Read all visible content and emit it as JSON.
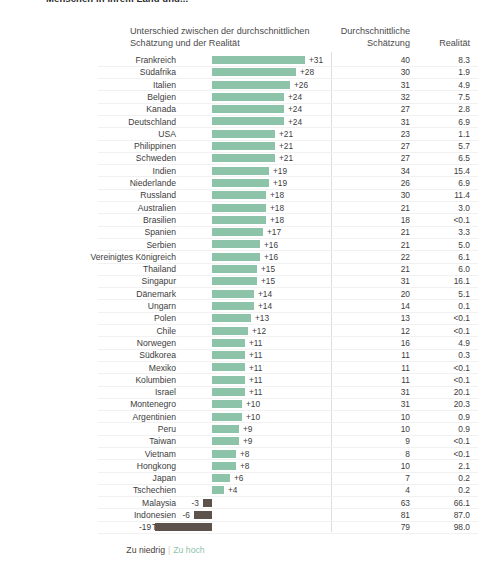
{
  "title": "Menschen in ihrem Land und...",
  "header": {
    "difference": "Unterschied zwischen der durchschnittlichen Schätzung und der Realität",
    "estimate": "Durchschnittliche Schätzung",
    "reality": "Realität"
  },
  "legend": {
    "too_low": "Zu niedrig",
    "separator": "|",
    "too_high": "Zu hoch"
  },
  "colors": {
    "positive_bar": "#8cc3a9",
    "negative_bar": "#5d524c",
    "gridline": "#f1f1f1",
    "divider": "#dddddd",
    "text": "#3d3d3d"
  },
  "chart_data": {
    "type": "bar",
    "title": "Menschen in ihrem Land und...",
    "xlabel": "Unterschied zwischen der durchschnittlichen Schätzung und der Realität",
    "ylabel": "",
    "orientation": "horizontal",
    "grid": true,
    "legend_position": "bottom",
    "xlim": [
      -19,
      31
    ],
    "columns": [
      "Land",
      "Unterschied",
      "Durchschnittliche Schätzung",
      "Realität"
    ],
    "categories": [
      "Frankreich",
      "Südafrika",
      "Italien",
      "Belgien",
      "Kanada",
      "Deutschland",
      "USA",
      "Philippinen",
      "Schweden",
      "Indien",
      "Niederlande",
      "Russland",
      "Australien",
      "Brasilien",
      "Spanien",
      "Serbien",
      "Vereinigtes Königreich",
      "Thailand",
      "Singapur",
      "Dänemark",
      "Ungarn",
      "Polen",
      "Chile",
      "Norwegen",
      "Südkorea",
      "Mexiko",
      "Kolumbien",
      "Israel",
      "Montenegro",
      "Argentinien",
      "Peru",
      "Taiwan",
      "Vietnam",
      "Hongkong",
      "Japan",
      "Tschechien",
      "Malaysia",
      "Indonesien",
      "Türkei"
    ],
    "values": [
      31,
      28,
      26,
      24,
      24,
      24,
      21,
      21,
      21,
      19,
      19,
      18,
      18,
      18,
      17,
      16,
      16,
      15,
      15,
      14,
      14,
      13,
      12,
      11,
      11,
      11,
      11,
      11,
      10,
      10,
      9,
      9,
      8,
      8,
      6,
      4,
      -3,
      -6,
      -19
    ],
    "estimate": [
      40,
      30,
      31,
      32,
      27,
      31,
      23,
      27,
      27,
      34,
      26,
      30,
      21,
      18,
      21,
      21,
      22,
      21,
      31,
      20,
      14,
      13,
      12,
      16,
      11,
      11,
      11,
      31,
      31,
      10,
      10,
      9,
      8,
      10,
      7,
      4,
      63,
      81,
      79
    ],
    "reality": [
      "8.3",
      "1.9",
      "4.9",
      "7.5",
      "2.8",
      "6.9",
      "1.1",
      "5.7",
      "6.5",
      "15.4",
      "6.9",
      "11.4",
      "3.0",
      "<0.1",
      "3.3",
      "5.0",
      "6.1",
      "6.0",
      "16.1",
      "5.1",
      "0.1",
      "<0.1",
      "<0.1",
      "4.9",
      "0.3",
      "<0.1",
      "<0.1",
      "20.1",
      "20.3",
      "0.9",
      "0.9",
      "<0.1",
      "<0.1",
      "2.1",
      "0.2",
      "0.2",
      "66.1",
      "87.0",
      "98.0"
    ],
    "labels": [
      "+31",
      "+28",
      "+26",
      "+24",
      "+24",
      "+24",
      "+21",
      "+21",
      "+21",
      "+19",
      "+19",
      "+18",
      "+18",
      "+18",
      "+17",
      "+16",
      "+16",
      "+15",
      "+15",
      "+14",
      "+14",
      "+13",
      "+12",
      "+11",
      "+11",
      "+11",
      "+11",
      "+11",
      "+10",
      "+10",
      "+9",
      "+9",
      "+8",
      "+8",
      "+6",
      "+4",
      "-3",
      "-6",
      "-19"
    ]
  }
}
